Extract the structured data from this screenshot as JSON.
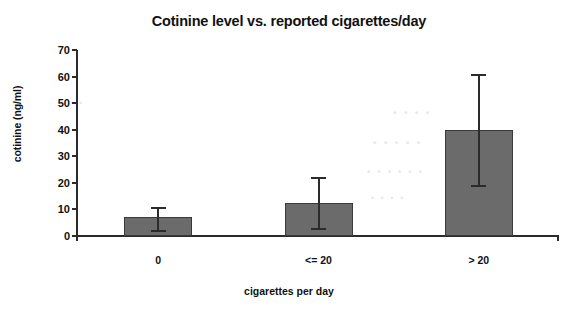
{
  "chart_data": {
    "type": "bar",
    "title": "Cotinine level vs. reported cigarettes/day",
    "xlabel": "cigarettes per day",
    "ylabel": "cotinine (ng/ml)",
    "categories": [
      "0",
      "<= 20",
      "> 20"
    ],
    "values": [
      7,
      12.5,
      40
    ],
    "errors": [
      {
        "category": "0",
        "value": 7,
        "lower": 2,
        "upper": 10.5
      },
      {
        "category": "<= 20",
        "value": 12.5,
        "lower": 2.5,
        "upper": 22
      },
      {
        "category": "> 20",
        "value": 40,
        "lower": 19,
        "upper": 60.5
      }
    ],
    "ylim": [
      0,
      70
    ],
    "ytick_labels": [
      "0",
      "10",
      "20",
      "30",
      "40",
      "50",
      "60",
      "70"
    ],
    "ytick_values": [
      0,
      10,
      20,
      30,
      40,
      50,
      60,
      70
    ],
    "grid": false,
    "legend": null,
    "bar_color": "#6b6b6b",
    "bar_edge_color": "#3a3a3a",
    "axis_color": "#2b2b2b",
    "background_color": "#ffffff"
  },
  "scan_artifacts": {
    "note": "faint reverse-page bleed-through, illegible",
    "lines": [
      "· · · ·",
      "· · · · ·",
      "· · · · · ·",
      "· · · ·",
      "· · ·"
    ]
  }
}
